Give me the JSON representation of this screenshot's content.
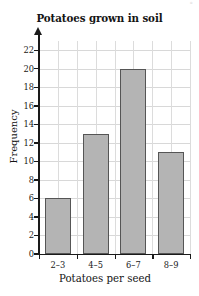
{
  "chart_data": {
    "type": "bar",
    "title": "Potatoes grown in soil",
    "xlabel": "Potatoes per seed",
    "ylabel": "Frequency",
    "categories": [
      "2–3",
      "4–5",
      "6–7",
      "8–9"
    ],
    "values": [
      6,
      13,
      20,
      11
    ],
    "ylim": [
      0,
      23
    ],
    "ytick_labels": [
      "0",
      "2",
      "4",
      "6",
      "8",
      "10",
      "12",
      "14",
      "16",
      "18",
      "20",
      "22"
    ],
    "ytick_values": [
      0,
      2,
      4,
      6,
      8,
      10,
      12,
      14,
      16,
      18,
      20,
      22
    ],
    "grid": true,
    "legend": null,
    "bar_color": "#b4b4b4",
    "bar_edge_color": "#555555",
    "axis_color": "#1a1a1a",
    "grid_color": "#d8d8d8"
  },
  "artifact": {
    "corner_mark": "°"
  }
}
